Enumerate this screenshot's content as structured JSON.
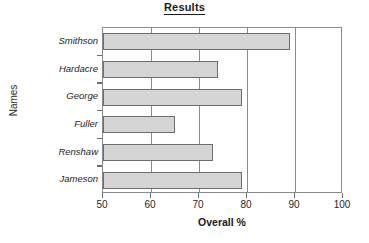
{
  "chart_data": {
    "type": "bar",
    "orientation": "horizontal",
    "title": "Results",
    "xlabel": "Overall %",
    "ylabel": "Names",
    "categories": [
      "Smithson",
      "Hardacre",
      "George",
      "Fuller",
      "Renshaw",
      "Jameson"
    ],
    "values": [
      89,
      74,
      79,
      65,
      73,
      79
    ],
    "series": [
      {
        "name": "Overall %",
        "values": [
          89,
          74,
          79,
          65,
          73,
          79
        ]
      }
    ],
    "xlim": [
      50,
      100
    ],
    "xticks": [
      50,
      60,
      70,
      80,
      90,
      100
    ],
    "xtick_labels": [
      "50",
      "60",
      "70",
      "80",
      "90",
      "100"
    ],
    "grid": "vertical",
    "legend": "none",
    "bar_fill_color": "#d5d5d5",
    "bar_border_color": "#6e6e6e",
    "axis_color": "#8a8a8a",
    "text_color": "#1a1a1a"
  }
}
